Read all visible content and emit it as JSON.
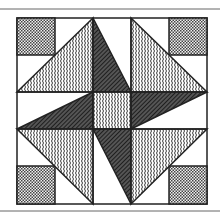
{
  "figure": {
    "type": "quilt-block",
    "colors": {
      "background": "#ffffff",
      "line": "#222222",
      "dotted_fill": "#8a8a8a",
      "hatch_fill": "#333333"
    },
    "patterns": [
      "dotted-gray",
      "wavy",
      "dark-hatch",
      "white"
    ]
  }
}
